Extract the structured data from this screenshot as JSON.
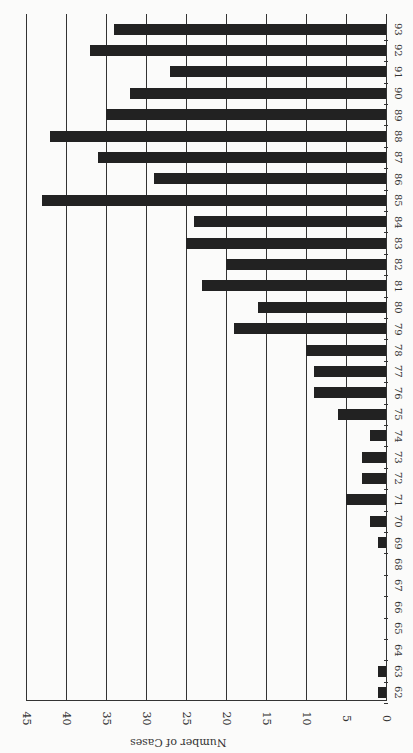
{
  "chart_data": {
    "type": "bar",
    "orientation": "rotated (horizontal bars, page rotated 90 degrees)",
    "title": "",
    "xlabel": "",
    "ylabel": "Number of Cases",
    "categories": [
      "62",
      "63",
      "64",
      "65",
      "66",
      "67",
      "68",
      "69",
      "70",
      "71",
      "72",
      "73",
      "74",
      "75",
      "76",
      "77",
      "78",
      "79",
      "80",
      "81",
      "82",
      "83",
      "84",
      "85",
      "86",
      "87",
      "88",
      "89",
      "90",
      "91",
      "92",
      "93"
    ],
    "values": [
      1,
      1,
      0,
      0,
      0,
      0,
      0,
      1,
      2,
      5,
      3,
      3,
      2,
      6,
      9,
      9,
      10,
      19,
      16,
      23,
      20,
      25,
      24,
      43,
      29,
      36,
      42,
      35,
      32,
      27,
      37,
      34
    ],
    "ylim": [
      0,
      45
    ],
    "yticks": [
      "0",
      "5",
      "10",
      "15",
      "20",
      "25",
      "30",
      "35",
      "40",
      "45"
    ],
    "grid": true,
    "legend": null
  },
  "axis": {
    "label": "Number of Cases"
  }
}
